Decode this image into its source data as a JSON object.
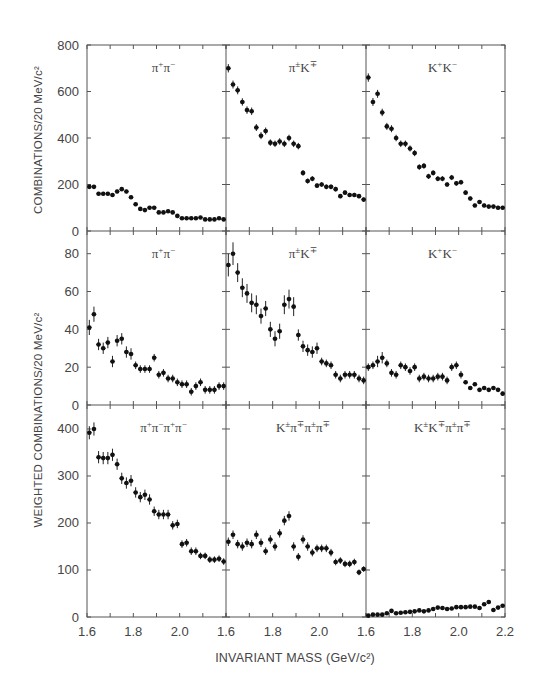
{
  "figure": {
    "x_axis_title": "INVARIANT MASS  (GeV/c²)",
    "y_axis_title_top": "COMBINATIONS/20 MeV/c²",
    "y_axis_title_bottom": "WEIGHTED COMBINATIONS/20 MeV/c²",
    "x_tick_labels": [
      [
        "1.6",
        "1.8",
        "2.0"
      ],
      [
        "1.6",
        "1.8",
        "2.0"
      ],
      [
        "1.6",
        "1.8",
        "2.0",
        "2.2"
      ]
    ]
  },
  "chart_data": {
    "type": "scatter",
    "title": "",
    "xlabel": "INVARIANT MASS (GeV/c^2)",
    "layout": "3x3 grid of panels sharing x axis 1.6-2.2 GeV/c^2, 20 MeV/c^2 bins, points with vertical error bars",
    "x": [
      1.61,
      1.63,
      1.65,
      1.67,
      1.69,
      1.71,
      1.73,
      1.75,
      1.77,
      1.79,
      1.81,
      1.83,
      1.85,
      1.87,
      1.89,
      1.91,
      1.93,
      1.95,
      1.97,
      1.99,
      2.01,
      2.03,
      2.05,
      2.07,
      2.09,
      2.11,
      2.13,
      2.15,
      2.17,
      2.19
    ],
    "xlim": [
      1.6,
      2.2
    ],
    "grid": false,
    "rows": [
      {
        "ylabel": "COMBINATIONS/20 MeV/c^2",
        "ylim": [
          0,
          800
        ],
        "yticks": [
          0,
          200,
          400,
          600,
          800
        ],
        "panels": [
          {
            "name": "pi+pi-",
            "label_parts": [
              "π",
              "+",
              "π",
              "−"
            ],
            "values": [
              190,
              190,
              160,
              160,
              160,
              155,
              170,
              180,
              170,
              145,
              115,
              95,
              90,
              100,
              100,
              80,
              80,
              85,
              80,
              65,
              55,
              55,
              55,
              55,
              58,
              50,
              50,
              50,
              55,
              50
            ],
            "errors": [
              8,
              8,
              8,
              8,
              8,
              8,
              8,
              8,
              8,
              8,
              8,
              7,
              7,
              7,
              7,
              7,
              7,
              7,
              7,
              6,
              6,
              6,
              6,
              6,
              6,
              6,
              6,
              6,
              6,
              6
            ]
          },
          {
            "name": "pi+-K-+",
            "label_parts": [
              "π",
              "±",
              "K",
              "∓"
            ],
            "values": [
              700,
              630,
              605,
              555,
              520,
              515,
              445,
              410,
              430,
              380,
              375,
              385,
              375,
              400,
              375,
              365,
              250,
              215,
              225,
              195,
              200,
              190,
              190,
              180,
              150,
              165,
              155,
              155,
              150,
              135
            ],
            "errors": [
              18,
              17,
              17,
              16,
              16,
              16,
              15,
              15,
              15,
              14,
              14,
              14,
              14,
              14,
              14,
              14,
              12,
              11,
              11,
              10,
              10,
              10,
              10,
              10,
              9,
              9,
              9,
              9,
              9,
              9
            ]
          },
          {
            "name": "K+K-",
            "label_parts": [
              "K",
              "+",
              "K",
              "−"
            ],
            "values": [
              660,
              555,
              590,
              510,
              450,
              440,
              400,
              375,
              375,
              355,
              335,
              275,
              280,
              235,
              250,
              225,
              225,
              200,
              230,
              205,
              210,
              165,
              140,
              110,
              125,
              110,
              105,
              105,
              100,
              100
            ],
            "errors": [
              18,
              17,
              17,
              16,
              15,
              15,
              14,
              14,
              14,
              13,
              13,
              12,
              12,
              11,
              11,
              11,
              11,
              10,
              11,
              10,
              10,
              9,
              9,
              8,
              8,
              8,
              8,
              8,
              8,
              8
            ]
          }
        ]
      },
      {
        "ylabel": "WEIGHTED COMBINATIONS/20 MeV/c^2",
        "ylim": [
          0,
          92
        ],
        "yticks": [
          0,
          20,
          40,
          60,
          80
        ],
        "panels": [
          {
            "name": "pi+pi- (weighted)",
            "label_parts": [
              "π",
              "+",
              "π",
              "−"
            ],
            "values": [
              41,
              48,
              32,
              30,
              33,
              23,
              34,
              35,
              28,
              27,
              21,
              19,
              19,
              19,
              25,
              16,
              17,
              14,
              14,
              12,
              11,
              11,
              7,
              10,
              12,
              8,
              8,
              8,
              10,
              10
            ],
            "errors": [
              4,
              4,
              3,
              3,
              3,
              3,
              3,
              3,
              3,
              3,
              2,
              2,
              2,
              2,
              2,
              2,
              2,
              2,
              2,
              2,
              2,
              2,
              2,
              2,
              2,
              2,
              2,
              2,
              2,
              2
            ]
          },
          {
            "name": "pi+-K-+ (weighted)",
            "label_parts": [
              "π",
              "±",
              "K",
              "∓"
            ],
            "values": [
              74,
              80,
              70,
              62,
              59,
              54,
              53,
              47,
              51,
              40,
              35,
              39,
              53,
              56,
              52,
              37,
              31,
              29,
              28,
              30,
              23,
              22,
              21,
              16,
              14,
              16,
              16,
              16,
              14,
              13
            ],
            "errors": [
              6,
              6,
              5,
              5,
              5,
              5,
              5,
              4,
              4,
              4,
              4,
              4,
              5,
              5,
              5,
              3,
              3,
              3,
              3,
              3,
              2,
              2,
              2,
              2,
              2,
              2,
              2,
              2,
              2,
              2
            ]
          },
          {
            "name": "K+K- (weighted)",
            "label_parts": [
              "K",
              "+",
              "K",
              "−"
            ],
            "values": [
              20,
              21,
              23,
              25,
              22,
              17,
              16,
              21,
              20,
              18,
              20,
              14,
              15,
              14,
              14,
              15,
              15,
              13,
              20,
              21,
              16,
              12,
              9,
              11,
              8,
              9,
              8,
              9,
              8,
              6
            ],
            "errors": [
              2,
              2,
              3,
              3,
              2,
              2,
              2,
              2,
              2,
              2,
              2,
              2,
              2,
              2,
              2,
              2,
              2,
              2,
              2,
              2,
              2,
              1,
              1,
              1,
              1,
              1,
              1,
              1,
              1,
              1
            ]
          }
        ]
      },
      {
        "ylabel": "WEIGHTED COMBINATIONS/20 MeV/c^2",
        "ylim": [
          0,
          451
        ],
        "yticks": [
          0,
          100,
          200,
          300,
          400
        ],
        "panels": [
          {
            "name": "pi+pi-pi+pi-",
            "label_parts": [
              "π",
              "+",
              "π",
              "−",
              "π",
              "+",
              "π",
              "−"
            ],
            "values": [
              392,
              400,
              340,
              338,
              338,
              345,
              325,
              295,
              285,
              290,
              265,
              255,
              260,
              250,
              225,
              218,
              218,
              218,
              195,
              198,
              155,
              158,
              140,
              140,
              130,
              130,
              122,
              122,
              124,
              118
            ],
            "errors": [
              14,
              14,
              13,
              13,
              13,
              13,
              12,
              12,
              12,
              12,
              11,
              11,
              11,
              11,
              10,
              10,
              10,
              10,
              9,
              9,
              8,
              8,
              8,
              8,
              7,
              7,
              7,
              7,
              7,
              7
            ]
          },
          {
            "name": "K+-pi-+pi+-pi-+",
            "label_parts": [
              "K",
              "±",
              "π",
              "∓",
              "π",
              "±",
              "π",
              "∓"
            ],
            "values": [
              160,
              175,
              155,
              150,
              158,
              155,
              175,
              158,
              140,
              165,
              150,
              178,
              205,
              215,
              150,
              128,
              165,
              150,
              137,
              146,
              146,
              146,
              137,
              117,
              120,
              113,
              113,
              117,
              95,
              102
            ],
            "errors": [
              9,
              9,
              9,
              9,
              9,
              9,
              9,
              9,
              8,
              9,
              9,
              9,
              10,
              10,
              9,
              8,
              9,
              9,
              8,
              8,
              8,
              8,
              8,
              7,
              7,
              7,
              7,
              7,
              6,
              6
            ]
          },
          {
            "name": "K+-K-+pi+-pi-+",
            "label_parts": [
              "K",
              "±",
              "K",
              "∓",
              "π",
              "±",
              "π",
              "∓"
            ],
            "values": [
              3,
              5,
              5,
              5,
              8,
              13,
              8,
              9,
              10,
              11,
              12,
              14,
              12,
              14,
              17,
              20,
              19,
              17,
              18,
              21,
              21,
              21,
              22,
              22,
              19,
              27,
              32,
              15,
              20,
              24
            ],
            "errors": [
              1,
              1,
              1,
              1,
              1,
              1,
              1,
              1,
              1,
              1,
              1,
              1,
              1,
              1,
              1,
              1,
              1,
              1,
              1,
              1,
              1,
              1,
              1,
              1,
              1,
              1,
              1,
              1,
              1,
              1
            ]
          }
        ]
      }
    ]
  }
}
